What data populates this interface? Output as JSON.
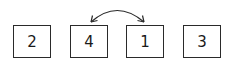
{
  "diagram": {
    "boxes": [
      {
        "label": "2",
        "x": 13
      },
      {
        "label": "4",
        "x": 70
      },
      {
        "label": "1",
        "x": 126
      },
      {
        "label": "3",
        "x": 183
      }
    ],
    "swap_arrow": {
      "from_box": 1,
      "to_box": 2,
      "style": "curved double-headed arrow",
      "color": "#2a2a2a"
    }
  }
}
